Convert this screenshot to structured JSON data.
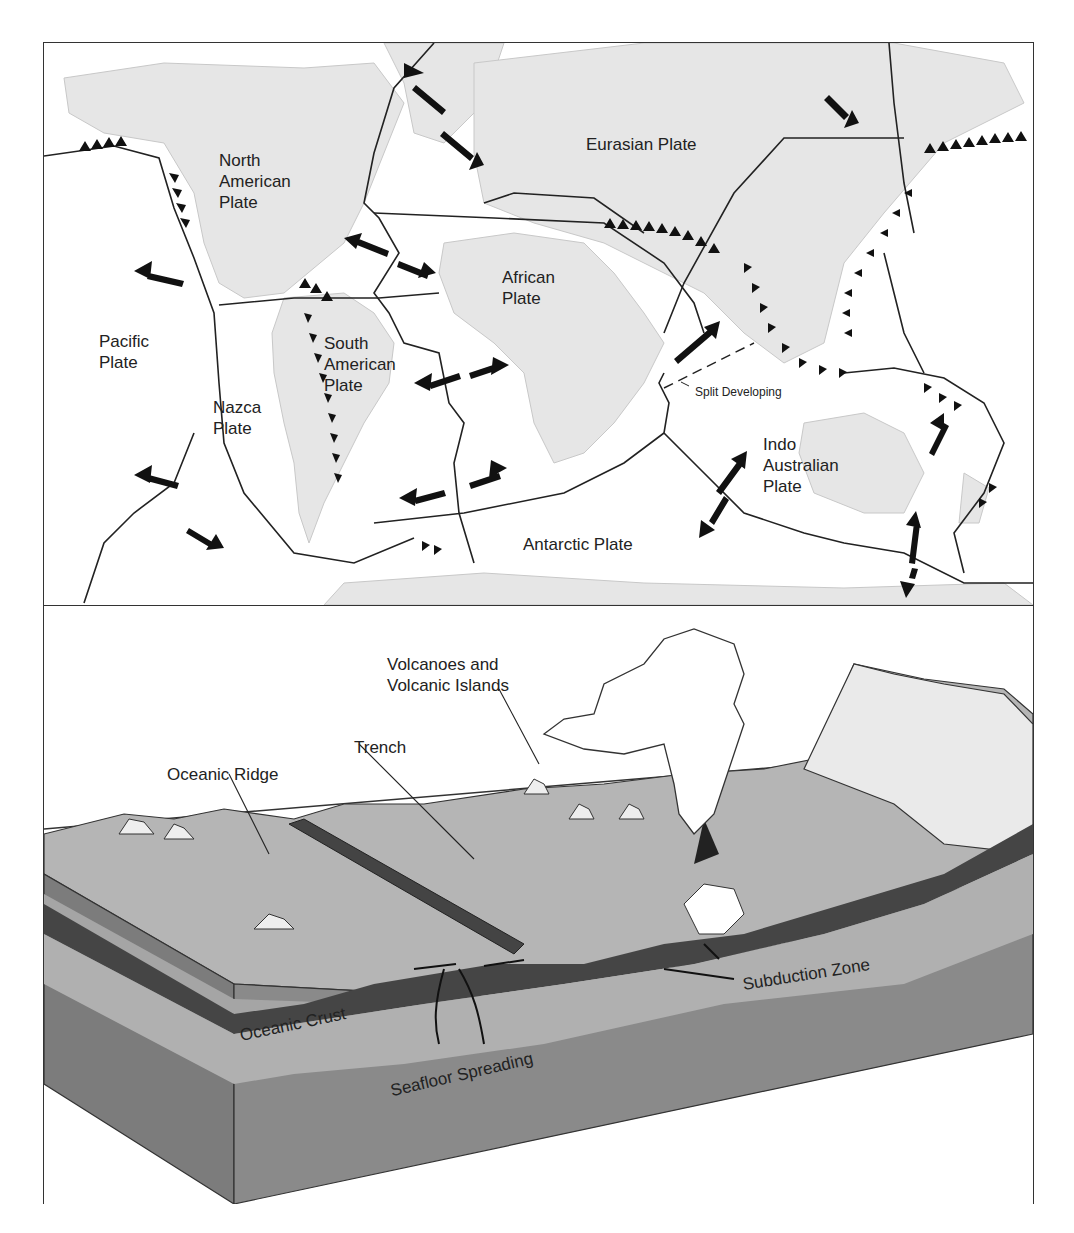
{
  "map": {
    "plates": [
      {
        "id": "north-american",
        "lines": [
          "North",
          "American",
          "Plate"
        ]
      },
      {
        "id": "eurasian",
        "lines": [
          "Eurasian Plate"
        ]
      },
      {
        "id": "african",
        "lines": [
          "African",
          "Plate"
        ]
      },
      {
        "id": "pacific",
        "lines": [
          "Pacific",
          "Plate"
        ]
      },
      {
        "id": "south-american",
        "lines": [
          "South",
          "American",
          "Plate"
        ]
      },
      {
        "id": "nazca",
        "lines": [
          "Nazca",
          "Plate"
        ]
      },
      {
        "id": "indo-australian",
        "lines": [
          "Indo",
          "Australian",
          "Plate"
        ]
      },
      {
        "id": "antarctic",
        "lines": [
          "Antarctic Plate"
        ]
      }
    ],
    "annotation": "Split Developing",
    "colors": {
      "land": "#e6e6e6",
      "ocean": "#ffffff",
      "boundary": "#222222",
      "arrow": "#111111"
    }
  },
  "block_diagram": {
    "labels": {
      "volcanoes": [
        "Volcanoes and",
        "Volcanic Islands"
      ],
      "trench": "Trench",
      "oceanic_ridge": "Oceanic Ridge",
      "subduction_zone": "Subduction Zone",
      "oceanic_crust": "Oceanic Crust",
      "seafloor_spreading": "Seafloor Spreading"
    },
    "colors": {
      "surface": "#b5b5b5",
      "crust": "#444444",
      "mantle": "#8a8a8a",
      "lithosphere": "#a8a8a8",
      "magma": "#ffffff"
    }
  }
}
